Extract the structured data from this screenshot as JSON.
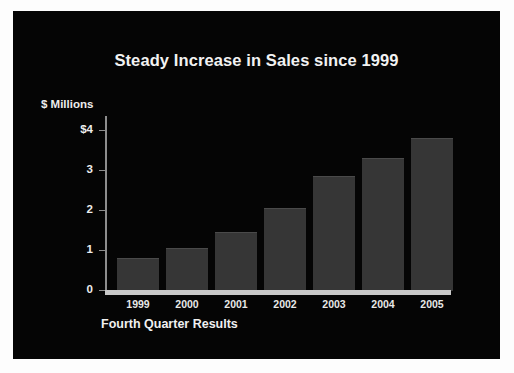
{
  "slide": {
    "background_color": "#050505",
    "page_background_color": "#fdfdfd"
  },
  "chart_data": {
    "type": "bar",
    "title": "Steady Increase in Sales since 1999",
    "xlabel": "Fourth Quarter Results",
    "ylabel": "$ Millions",
    "categories": [
      "1999",
      "2000",
      "2001",
      "2002",
      "2003",
      "2004",
      "2005"
    ],
    "values": [
      0.8,
      1.05,
      1.45,
      2.05,
      2.85,
      3.3,
      3.8
    ],
    "ylim": [
      0,
      4
    ],
    "ytick_values": [
      4,
      3,
      2,
      1,
      0
    ],
    "ytick_labels": [
      "$4",
      "3",
      "2",
      "1",
      "0"
    ],
    "grid": false,
    "legend": null,
    "bar_color": "#363636",
    "axis_color": "#8d8d8d",
    "baseline_color": "#c9c9c9",
    "text_color": "#f0f0f0"
  }
}
